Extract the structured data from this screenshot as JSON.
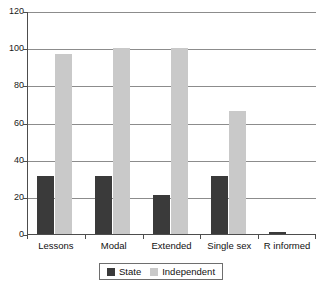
{
  "chart_data": {
    "type": "bar",
    "title": "",
    "xlabel": "",
    "ylabel": "",
    "categories": [
      "Lessons",
      "Modal",
      "Extended",
      "Single sex",
      "R informed"
    ],
    "series": [
      {
        "name": "State",
        "color": "#3a3a3a",
        "values": [
          31,
          31,
          21,
          31,
          1
        ]
      },
      {
        "name": "Independent",
        "color": "#c9c9c9",
        "values": [
          97,
          100,
          100,
          66,
          0
        ]
      }
    ],
    "ylim": [
      0,
      120
    ],
    "yticks": [
      0,
      20,
      40,
      60,
      80,
      100,
      120
    ],
    "ytick_labels": [
      "0",
      "20",
      "40",
      "60",
      "80",
      "100",
      "120"
    ],
    "grid": true,
    "grid_axis": "y",
    "legend_position": "bottom"
  },
  "legend": {
    "entries": [
      {
        "label": "State"
      },
      {
        "label": "Independent"
      }
    ]
  }
}
